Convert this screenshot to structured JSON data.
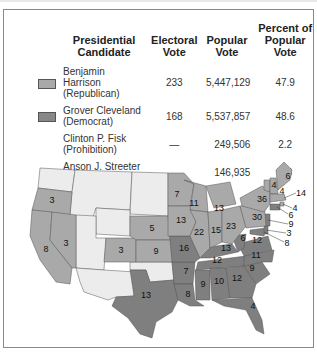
{
  "table": {
    "headers": {
      "candidate": "Presidential Candidate",
      "electoral": "Electoral Vote",
      "popular": "Popular Vote",
      "percent": "Percent of Popular Vote"
    },
    "rows": [
      {
        "name": "Benjamin Harrison",
        "party": "(Republican)",
        "electoral": "233",
        "popular": "5,447,129",
        "percent": "47.9",
        "swatch": "#a9a9a9"
      },
      {
        "name": "Grover Cleveland",
        "party": "(Democrat)",
        "electoral": "168",
        "popular": "5,537,857",
        "percent": "48.6",
        "swatch": "#888888"
      },
      {
        "name": "Clinton P. Fisk",
        "party": "(Prohibition)",
        "electoral": "—",
        "popular": "249,506",
        "percent": "2.2"
      },
      {
        "name": "Anson J. Streeter",
        "party": "(Union Labor)",
        "electoral": "—",
        "popular": "146,935",
        "percent": "1.3"
      }
    ]
  },
  "colors": {
    "republican": "#a9a9a9",
    "democrat": "#7f7f7f",
    "territory": "#ececec",
    "border": "#555555"
  },
  "map": {
    "labels": {
      "OR": "3",
      "NV": "3",
      "CA": "8",
      "CO": "3",
      "NE": "5",
      "KS": "9",
      "TX": "13",
      "MN": "7",
      "WI": "11",
      "IA": "13",
      "MO": "16",
      "AR": "7",
      "LA": "8",
      "IL": "22",
      "MI": "13",
      "IN": "15",
      "OH": "23",
      "KY": "13",
      "TN": "12",
      "MS": "9",
      "AL": "10",
      "GA": "12",
      "FL": "4",
      "SC": "9",
      "NC": "11",
      "VA": "12",
      "WV": "6",
      "PA": "30",
      "NY": "36",
      "VT": "4",
      "NH": "4",
      "ME": "6",
      "MA": "14",
      "RI": "4",
      "CT": "6",
      "NJ": "9",
      "DE": "3",
      "MD": "8"
    }
  }
}
